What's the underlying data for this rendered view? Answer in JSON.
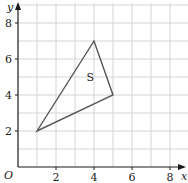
{
  "diagram": {
    "type": "coordinate-grid",
    "x_axis": {
      "label": "x",
      "min": 0,
      "max": 9,
      "ticks": [
        "2",
        "4",
        "6",
        "8"
      ]
    },
    "y_axis": {
      "label": "y",
      "min": 0,
      "max": 9,
      "ticks": [
        "2",
        "4",
        "6",
        "8"
      ]
    },
    "origin_label": "O",
    "shape": {
      "label": "S",
      "vertices": [
        [
          1,
          2
        ],
        [
          4,
          7
        ],
        [
          5,
          4
        ]
      ],
      "label_position": [
        3.6,
        4.8
      ]
    },
    "colors": {
      "grid": "#d4d4d4",
      "axis": "#1a1a1a",
      "shape": "#555555"
    }
  }
}
